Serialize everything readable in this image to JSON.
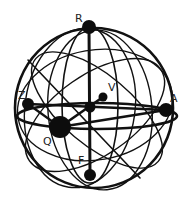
{
  "diagram": {
    "type": "sphere-graph",
    "colors": {
      "line": "#111111",
      "node": "#0d0d0d",
      "label": "#222222",
      "background": "#ffffff"
    },
    "nodes": [
      {
        "id": "R",
        "label": "R",
        "x": 89,
        "y": 27,
        "r": 7
      },
      {
        "id": "Z",
        "label": "Z",
        "x": 28,
        "y": 104,
        "r": 6
      },
      {
        "id": "V",
        "label": "V",
        "x": 103,
        "y": 97,
        "r": 4.5
      },
      {
        "id": "center",
        "label": "",
        "x": 90,
        "y": 107,
        "r": 5.5
      },
      {
        "id": "A",
        "label": "A",
        "x": 166,
        "y": 110,
        "r": 7
      },
      {
        "id": "Q",
        "label": "Q",
        "x": 60,
        "y": 127,
        "r": 11
      },
      {
        "id": "F",
        "label": "F",
        "x": 90,
        "y": 175,
        "r": 6
      }
    ],
    "labels": {
      "R": "R",
      "Z": "Z",
      "V": "V",
      "A": "A",
      "Q": "Q",
      "F": "F"
    }
  }
}
